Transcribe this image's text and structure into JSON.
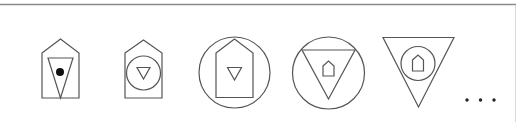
{
  "diagram": {
    "colors": {
      "stroke": "#555555",
      "frame": "#8a8a8a",
      "fill_dot": "#111111",
      "background": "#ffffff"
    },
    "shapes": [
      {
        "index": 1,
        "label": "house containing inverted triangle containing dot",
        "nesting": [
          "house",
          "inverted-triangle",
          "dot"
        ]
      },
      {
        "index": 2,
        "label": "house containing circle containing inverted triangle",
        "nesting": [
          "house",
          "circle",
          "inverted-triangle"
        ]
      },
      {
        "index": 3,
        "label": "circle containing house containing inverted triangle",
        "nesting": [
          "circle",
          "house",
          "inverted-triangle"
        ]
      },
      {
        "index": 4,
        "label": "circle containing inverted triangle containing house",
        "nesting": [
          "circle",
          "inverted-triangle",
          "house"
        ]
      },
      {
        "index": 5,
        "label": "inverted triangle containing circle containing house",
        "nesting": [
          "inverted-triangle",
          "circle",
          "house"
        ]
      }
    ],
    "continuation": "..."
  }
}
